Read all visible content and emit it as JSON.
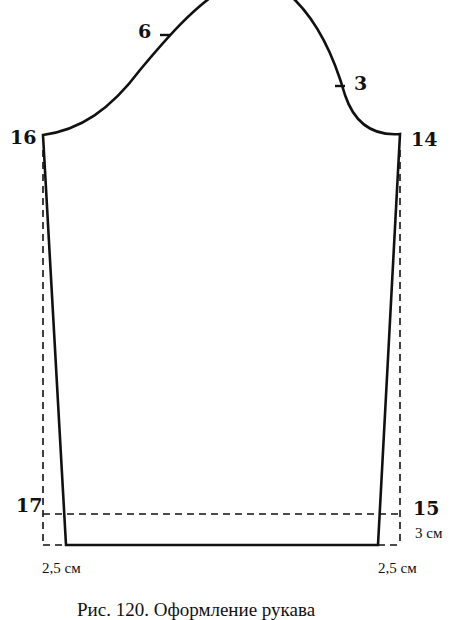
{
  "diagram": {
    "type": "sleeve-pattern",
    "colors": {
      "line": "#111111",
      "background": "#ffffff"
    },
    "points": [
      {
        "id": "16",
        "label": "16",
        "x": 43,
        "y": 135
      },
      {
        "id": "14",
        "label": "14",
        "x": 400,
        "y": 134
      },
      {
        "id": "17",
        "label": "17",
        "x": 43,
        "y": 514
      },
      {
        "id": "15",
        "label": "15",
        "x": 400,
        "y": 514
      }
    ],
    "notches": [
      {
        "label": "6",
        "x": 165,
        "y": 34
      },
      {
        "label": "3",
        "x": 340,
        "y": 85
      }
    ],
    "dimensions": {
      "hem_height": "3 см",
      "left_offset": "2,5 см",
      "right_offset": "2,5 см"
    },
    "caption": "Рис. 120. Оформление рукава"
  }
}
